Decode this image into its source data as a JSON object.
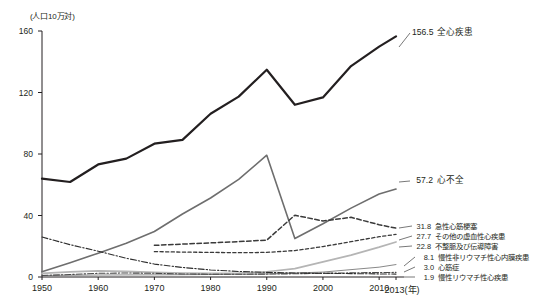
{
  "chart_data": {
    "type": "line",
    "title": "",
    "xlabel": "年",
    "ylabel": "(人口10万対)",
    "yunit_label": "(人口10万対)",
    "xaxis_suffix": "(年)",
    "x": [
      1950,
      1955,
      1960,
      1965,
      1970,
      1975,
      1980,
      1985,
      1990,
      1995,
      2000,
      2005,
      2010,
      2013
    ],
    "xticks": [
      "1950",
      "1960",
      "1970",
      "1980",
      "1990",
      "2000",
      "2010",
      "2013"
    ],
    "xtick_values": [
      1950,
      1960,
      1970,
      1980,
      1990,
      2000,
      2010,
      2013
    ],
    "yticks": [
      "0",
      "40",
      "80",
      "120",
      "160"
    ],
    "ytick_values": [
      0,
      40,
      80,
      120,
      160
    ],
    "ylim": [
      0,
      160
    ],
    "xlim": [
      1950,
      2013
    ],
    "grid": false,
    "legend_position": "right-inline",
    "series": [
      {
        "name": "全心疾患",
        "label": "全心疾患",
        "end_value": "156.5",
        "style": "solid",
        "color": "#231f20",
        "width": 2.2,
        "x": [
          1950,
          1955,
          1960,
          1965,
          1970,
          1975,
          1980,
          1985,
          1990,
          1995,
          2000,
          2005,
          2010,
          2013
        ],
        "values": [
          64.0,
          61.8,
          73.2,
          77.0,
          86.7,
          89.2,
          106.2,
          117.3,
          134.8,
          112.0,
          116.8,
          137.2,
          149.8,
          156.5
        ]
      },
      {
        "name": "心不全",
        "label": "心不全",
        "end_value": "57.2",
        "style": "solid",
        "color": "#6e6e6e",
        "width": 1.6,
        "x": [
          1950,
          1955,
          1960,
          1965,
          1970,
          1975,
          1980,
          1985,
          1990,
          1995,
          2000,
          2005,
          2010,
          2013
        ],
        "values": [
          3.4,
          9.3,
          15.5,
          21.9,
          29.6,
          41.0,
          51.4,
          63.5,
          79.2,
          25.0,
          34.6,
          44.8,
          54.0,
          57.2
        ]
      },
      {
        "name": "急性心筋梗塞",
        "label": "急性心筋梗塞",
        "end_value": "31.8",
        "style": "dashed",
        "color": "#3a3a3a",
        "width": 1.5,
        "x": [
          1970,
          1975,
          1980,
          1985,
          1990,
          1995,
          2000,
          2005,
          2010,
          2013
        ],
        "values": [
          20.6,
          21.4,
          22.2,
          23.0,
          24.0,
          40.2,
          36.4,
          38.8,
          34.0,
          31.8
        ]
      },
      {
        "name": "その他の虚血性心疾患",
        "label": "その他の虚血性心疾患",
        "end_value": "27.7",
        "style": "dashed-fine",
        "color": "#3a3a3a",
        "width": 1.3,
        "x": [
          1970,
          1975,
          1980,
          1985,
          1990,
          1995,
          2000,
          2005,
          2010,
          2013
        ],
        "values": [
          16.5,
          16.2,
          16.0,
          15.8,
          16.0,
          17.2,
          19.8,
          23.0,
          26.2,
          27.7
        ]
      },
      {
        "name": "不整脈及び伝導障害",
        "label": "不整脈及び伝導障害",
        "end_value": "22.8",
        "style": "solid",
        "color": "#b5b5b5",
        "width": 1.7,
        "x": [
          1950,
          1955,
          1960,
          1965,
          1970,
          1975,
          1980,
          1985,
          1990,
          1995,
          2000,
          2005,
          2010,
          2013
        ],
        "values": [
          2.3,
          3.3,
          4.0,
          3.6,
          3.0,
          2.6,
          2.4,
          2.6,
          3.4,
          5.4,
          9.8,
          14.2,
          19.4,
          22.8
        ]
      },
      {
        "name": "慢性非リウマチ性心内膜疾患",
        "label": "慢性非リウマチ性心内膜疾患",
        "end_value": "8.1",
        "style": "solid-thin",
        "color": "#7a7a7a",
        "width": 0.9,
        "x": [
          1950,
          1960,
          1970,
          1980,
          1990,
          2000,
          2010,
          2013
        ],
        "values": [
          1.0,
          1.3,
          1.4,
          1.6,
          2.0,
          3.2,
          6.4,
          8.1
        ]
      },
      {
        "name": "心筋症",
        "label": "心筋症",
        "end_value": "3.0",
        "style": "dash-dot",
        "color": "#4a4a4a",
        "width": 1.1,
        "x": [
          1950,
          1955,
          1960,
          1965,
          1970,
          1975,
          1980,
          1985,
          1990,
          1995,
          2000,
          2005,
          2010,
          2013
        ],
        "values": [
          1.0,
          1.6,
          2.4,
          2.6,
          2.4,
          2.0,
          1.8,
          1.8,
          1.9,
          2.1,
          2.4,
          2.7,
          2.9,
          3.0
        ]
      },
      {
        "name": "慢性リウマチ性心疾患",
        "label": "慢性リウマチ性心疾患",
        "end_value": "1.9",
        "style": "dash-dot",
        "color": "#2e2e2e",
        "width": 1.1,
        "x": [
          1950,
          1955,
          1960,
          1965,
          1970,
          1975,
          1980,
          1985,
          1990,
          1995,
          2000,
          2005,
          2010,
          2013
        ],
        "values": [
          26.0,
          21.0,
          16.8,
          12.2,
          8.4,
          6.2,
          4.6,
          3.6,
          3.0,
          2.6,
          2.4,
          2.2,
          2.0,
          1.9
        ]
      }
    ]
  }
}
